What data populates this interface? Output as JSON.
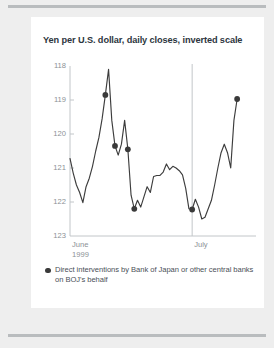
{
  "page": {
    "background_color": "#eeeeee",
    "card_color": "#ffffff",
    "rule_color": "#b9bcbe"
  },
  "chart_title": "Yen per U.S. dollar, daily closes, inverted scale",
  "legend": {
    "marker_icon": "filled-circle-icon",
    "marker_color": "#3a3a3a",
    "text": "Direct interventions by Bank of Japan or other central banks on BOJ's behalf"
  },
  "chart_data": {
    "type": "line",
    "title": "Yen per U.S. dollar, daily closes, inverted scale",
    "xlabel": "",
    "ylabel": "",
    "inverted_yaxis": true,
    "ylim": [
      118,
      123
    ],
    "yticks": [
      118,
      119,
      120,
      121,
      122,
      123
    ],
    "ytick_labels": [
      "118",
      "119",
      "120",
      "121",
      "122",
      "123"
    ],
    "xtick_labels": [
      "June\n1999",
      "July"
    ],
    "xticks": [
      0,
      38
    ],
    "xlim": [
      0,
      56
    ],
    "grid": false,
    "legend_position": "below",
    "line_color": "#3d3d3d",
    "series": [
      {
        "name": "Yen per U.S. dollar",
        "x": [
          0,
          1,
          2,
          3,
          4,
          5,
          6,
          7,
          8,
          9,
          10,
          11,
          12,
          13,
          14,
          15,
          16,
          17,
          18,
          19,
          20,
          21,
          22,
          23,
          24,
          25,
          26,
          27,
          28,
          29,
          30,
          31,
          32,
          33,
          34,
          35,
          36,
          37,
          38,
          39,
          40,
          41,
          42,
          43,
          44,
          45,
          46,
          47,
          48,
          49,
          50,
          51,
          52
        ],
        "values": [
          120.72,
          121.15,
          121.5,
          121.72,
          122.02,
          121.55,
          121.3,
          120.95,
          120.5,
          120.1,
          119.55,
          118.85,
          118.1,
          119.6,
          120.35,
          120.62,
          120.3,
          119.6,
          120.45,
          121.8,
          122.2,
          121.95,
          122.15,
          121.85,
          121.55,
          121.72,
          121.25,
          121.22,
          121.22,
          121.12,
          120.88,
          121.05,
          120.95,
          121.0,
          121.08,
          121.2,
          121.6,
          122.2,
          122.22,
          121.92,
          122.15,
          122.5,
          122.45,
          122.2,
          121.95,
          121.5,
          121.0,
          120.55,
          120.3,
          120.55,
          121.0,
          119.6,
          118.97
        ]
      }
    ],
    "intervention_markers": {
      "label": "Direct interventions by Bank of Japan or other central banks on BOJ's behalf",
      "color": "#3a3a3a",
      "points": [
        {
          "x": 11,
          "y": 118.85
        },
        {
          "x": 14,
          "y": 120.35
        },
        {
          "x": 18,
          "y": 120.45
        },
        {
          "x": 20,
          "y": 122.2
        },
        {
          "x": 38,
          "y": 122.22
        },
        {
          "x": 52,
          "y": 118.97
        }
      ]
    },
    "annotations": [
      {
        "type": "vline",
        "x": 38,
        "label": "July",
        "color": "#c2c6c9"
      }
    ]
  }
}
